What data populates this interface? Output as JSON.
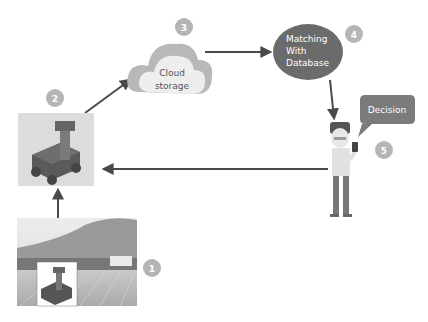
{
  "diagram": {
    "title": "",
    "colors": {
      "arrow": "#4a4a4a",
      "step_badge": "#b5b5b5",
      "step_badge_text": "#ffffff",
      "cloud_outer": "#b8b8b8",
      "cloud_inner": "#eeeeee",
      "ellipse": "#6b6b6b",
      "bubble": "#7b7b7b",
      "robot_body": "#555555",
      "robot_tile_bg": "#dcdcdc"
    },
    "steps": [
      {
        "number": "1",
        "label": "Field photo with robot",
        "icon": "field-photo"
      },
      {
        "number": "2",
        "label": "Robot",
        "icon": "robot-icon"
      },
      {
        "number": "3",
        "label": "Cloud storage",
        "lines": [
          "Cloud",
          "storage"
        ],
        "icon": "cloud-icon"
      },
      {
        "number": "4",
        "label": "Matching With Database",
        "lines": [
          "Matching",
          "With",
          "Database"
        ],
        "icon": "database-ellipse"
      },
      {
        "number": "5",
        "label": "Decision",
        "icon": "person-with-phone"
      }
    ],
    "flows": [
      {
        "from": "1",
        "to": "2",
        "direction": "up"
      },
      {
        "from": "2",
        "to": "3",
        "direction": "up-right"
      },
      {
        "from": "3",
        "to": "4",
        "direction": "right"
      },
      {
        "from": "4",
        "to": "5",
        "direction": "down"
      },
      {
        "from": "5",
        "to": "2",
        "direction": "left"
      }
    ]
  }
}
